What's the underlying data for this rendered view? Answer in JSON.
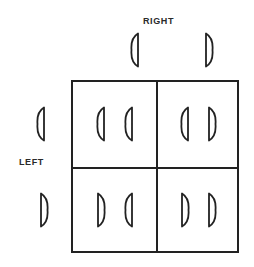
{
  "labels": {
    "column_header": "RIGHT",
    "row_header": "LEFT"
  },
  "colors": {
    "line": "#222222",
    "text": "#2a2a2a",
    "background": "#ffffff"
  },
  "glyph_types": {
    "L": "left-half-lens (curved left, flat right)",
    "R": "right-half-lens (flat left, curved right)"
  },
  "column_headers": [
    "L",
    "R"
  ],
  "row_headers": [
    "L",
    "R"
  ],
  "cells": [
    [
      [
        "L",
        "L"
      ],
      [
        "L",
        "R"
      ]
    ],
    [
      [
        "R",
        "L"
      ],
      [
        "R",
        "R"
      ]
    ]
  ]
}
